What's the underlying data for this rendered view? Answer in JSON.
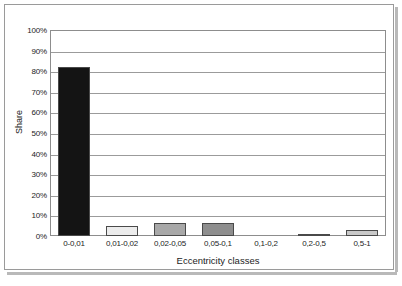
{
  "chart_data": {
    "type": "bar",
    "title": "",
    "xlabel": "Eccentricity classes",
    "ylabel": "Share",
    "categories": [
      "0-0,01",
      "0,01-0,02",
      "0,02-0,05",
      "0,05-0,1",
      "0,1-0,2",
      "0,2-0,5",
      "0,5-1"
    ],
    "values": [
      82,
      5,
      6.5,
      6.5,
      0,
      1,
      3
    ],
    "value_labels": [
      "82%",
      "5%",
      "6.5%",
      "6.5%",
      "0%",
      "1%",
      "3%"
    ],
    "bar_colors": [
      "#141414",
      "#ececec",
      "#a8a8a8",
      "#8e8e8e",
      "#ffffff",
      "#585858",
      "#c9c9c9"
    ],
    "bar_border_color": "#4a4a4a",
    "ylim": [
      0,
      100
    ],
    "y_ticks": [
      0,
      10,
      20,
      30,
      40,
      50,
      60,
      70,
      80,
      90,
      100
    ],
    "y_tick_labels": [
      "0%",
      "10%",
      "20%",
      "30%",
      "40%",
      "50%",
      "60%",
      "70%",
      "80%",
      "90%",
      "100%"
    ],
    "grid": true,
    "grid_color": "#9b9b9b",
    "legend": "none",
    "plot_border_color": "#8d8d8d",
    "frame_border_color": "#9a9a9a"
  }
}
